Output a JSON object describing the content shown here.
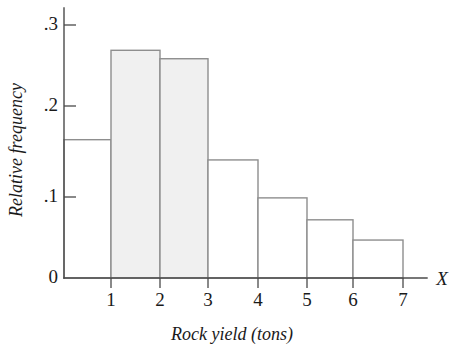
{
  "chart_data": {
    "type": "bar",
    "title": "",
    "subtitle": "",
    "xlabel": "Rock yield (tons)",
    "ylabel": "Relative frequency",
    "x_axis_variable": "X",
    "categories": [
      "0-1",
      "1-2",
      "2-3",
      "3-4",
      "4-5",
      "5-6",
      "6-7"
    ],
    "bin_edges": [
      0,
      1,
      2,
      3,
      4,
      5,
      6,
      7
    ],
    "values": [
      0.164,
      0.27,
      0.26,
      0.14,
      0.095,
      0.069,
      0.045
    ],
    "bar_styles": [
      "plain",
      "shaded",
      "shaded",
      "plain",
      "plain",
      "plain",
      "plain"
    ],
    "xtick_labels": [
      "1",
      "2",
      "3",
      "4",
      "5",
      "6",
      "7"
    ],
    "ytick_labels": [
      "0",
      ".1",
      ".2",
      ".3"
    ],
    "ytick_values": [
      0,
      0.1,
      0.2,
      0.3
    ],
    "ylim": [
      0,
      0.32
    ],
    "xlim": [
      0,
      7
    ],
    "grid": false,
    "legend": false,
    "legend_position": "none",
    "annotations": []
  },
  "colors": {
    "background": "#ffffff",
    "axis": "#4a4a4a",
    "bar_outline": "#8e8e8e",
    "bar_fill_shaded": "#f0f0f0",
    "bar_fill_plain": "#ffffff",
    "text": "#1a1a1a"
  }
}
